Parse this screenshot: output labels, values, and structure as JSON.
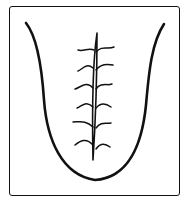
{
  "diagram": {
    "features": [
      "central-fissure",
      "branching-cracks"
    ],
    "colors": {
      "stroke": "#111111",
      "background": "#ffffff"
    },
    "branch_count": {
      "left": 6,
      "right": 6
    }
  }
}
